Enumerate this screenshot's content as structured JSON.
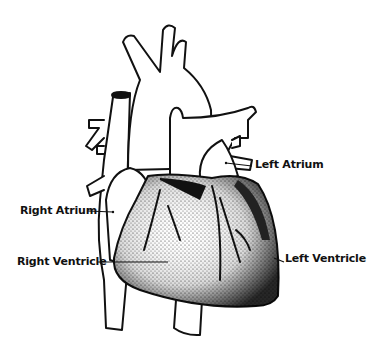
{
  "diagram": {
    "labels": [
      {
        "id": "left-atrium",
        "text": "Left Atrium"
      },
      {
        "id": "right-atrium",
        "text": "Right Atrium"
      },
      {
        "id": "right-ventricle",
        "text": "Right Ventricle"
      },
      {
        "id": "left-ventricle",
        "text": "Left Ventricle"
      }
    ],
    "colors": {
      "ink": "#111111",
      "background": "#ffffff",
      "stipple": "#555555"
    }
  }
}
